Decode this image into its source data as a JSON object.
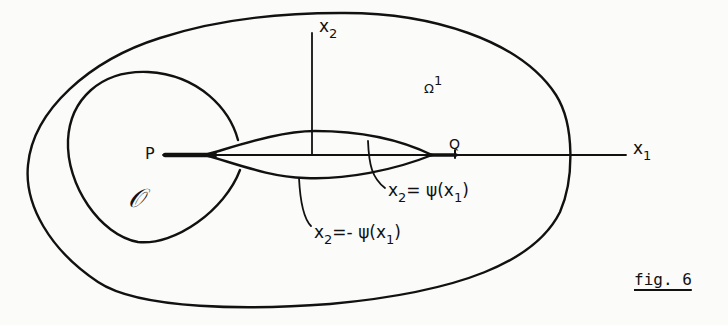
{
  "figure": {
    "caption": "fig. 6",
    "axes": {
      "x1": {
        "base": "x",
        "sub": "1"
      },
      "x2": {
        "base": "x",
        "sub": "2"
      }
    },
    "points": {
      "P": "P",
      "Q": "Q"
    },
    "regions": {
      "omega": {
        "base": "Ω",
        "sup": "1"
      },
      "o": "𝒪"
    },
    "curves": {
      "upper": {
        "lhs_base": "x",
        "lhs_sub": "2",
        "rhs": "= ψ(x",
        "rhs_sub": "1",
        "close": ")"
      },
      "lower": {
        "lhs_base": "x",
        "lhs_sub": "2",
        "rhs": "=- ψ(x",
        "rhs_sub": "1",
        "close": ")"
      }
    },
    "colors": {
      "ink": "#111111",
      "paper": "#fbfbf9"
    }
  }
}
